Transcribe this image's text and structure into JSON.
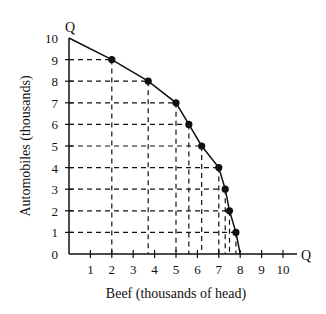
{
  "chart_data": {
    "type": "line",
    "title": "",
    "xlabel": "Beef (thousands of head)",
    "ylabel": "Automobiles (thousands)",
    "x_axis_end_label": "Q",
    "y_axis_end_label": "Q",
    "xlim": [
      0,
      10
    ],
    "ylim": [
      0,
      10
    ],
    "x_ticks": [
      "1",
      "2",
      "3",
      "4",
      "5",
      "6",
      "7",
      "8",
      "9",
      "10"
    ],
    "y_ticks": [
      "0",
      "1",
      "2",
      "3",
      "4",
      "5",
      "6",
      "7",
      "8",
      "9",
      "10"
    ],
    "grid": "dashed projection lines from each point to axes",
    "series": [
      {
        "name": "Production possibilities frontier",
        "x": [
          0,
          2,
          3.7,
          5,
          5.6,
          6.2,
          7,
          7.3,
          7.5,
          7.8,
          8
        ],
        "y": [
          10,
          9,
          8,
          7,
          6,
          5,
          4,
          3,
          2,
          1,
          0
        ],
        "marked_points": [
          [
            2,
            9
          ],
          [
            3.7,
            8
          ],
          [
            5,
            7
          ],
          [
            5.6,
            6
          ],
          [
            6.2,
            5
          ],
          [
            7,
            4
          ],
          [
            7.3,
            3
          ],
          [
            7.5,
            2
          ],
          [
            7.8,
            1
          ]
        ]
      }
    ]
  },
  "colors": {
    "line": "#111111",
    "dash": "#111111",
    "background": "#ffffff"
  }
}
